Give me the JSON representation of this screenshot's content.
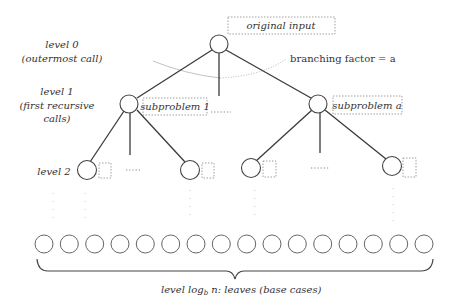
{
  "diagram": {
    "type": "recursion-tree",
    "colors": {
      "edge": "#3a3a3a",
      "node_stroke": "#444444",
      "label_text": "#333333",
      "dashed_box": "#888888"
    },
    "level_labels": {
      "level0_line1": "level 0",
      "level0_line2": "(outermost call)",
      "level1_line1": "level 1",
      "level1_line2": "(first recursive",
      "level1_line3": "calls)",
      "level2": "level 2"
    },
    "root": {
      "label": "original input"
    },
    "branching_factor": {
      "label": "branching factor = a"
    },
    "level1_nodes": [
      {
        "label": "subproblem 1"
      },
      {
        "label": "subproblem a"
      }
    ],
    "ellipsis_h": "......",
    "leaves": {
      "count": 16,
      "caption_prefix": "level log",
      "caption_sub": "b",
      "caption_suffix": " n: leaves (base cases)"
    }
  }
}
